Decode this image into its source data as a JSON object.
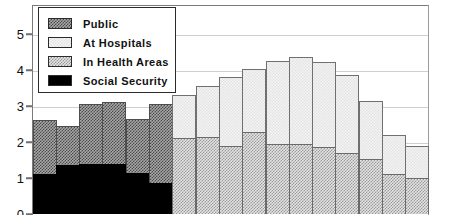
{
  "chart_data": {
    "type": "bar",
    "title": "",
    "subtitle": "",
    "xlabel": "",
    "ylabel": "",
    "stacked": true,
    "grid": true,
    "legend_position": "top-left",
    "ylim": [
      0,
      5.55
    ],
    "yticks": [
      0,
      1,
      2,
      3,
      4,
      5
    ],
    "ytick_labels": [
      "0",
      "1",
      "2",
      "3",
      "4",
      "5"
    ],
    "categories": [
      "1",
      "2",
      "3",
      "4",
      "5",
      "6",
      "7",
      "8",
      "9",
      "10",
      "11",
      "12",
      "13",
      "14",
      "15",
      "16",
      "17"
    ],
    "series": [
      {
        "name": "Public",
        "color": "#7a7a7a",
        "pattern": "dark-checker",
        "values": [
          1.5,
          1.1,
          1.65,
          1.7,
          1.5,
          2.2,
          0,
          0,
          0,
          0,
          0,
          0,
          0,
          0,
          0,
          0,
          0
        ]
      },
      {
        "name": "At Hospitals",
        "color": "#f2f2f2",
        "pattern": "light-plain",
        "values": [
          0,
          0,
          0,
          0,
          0,
          0,
          1.2,
          1.4,
          1.9,
          1.75,
          2.3,
          2.4,
          2.35,
          2.15,
          1.6,
          1.1,
          0.9
        ]
      },
      {
        "name": "In Health Areas",
        "color": "#c9c9c9",
        "pattern": "light-checker",
        "values": [
          0,
          0,
          0,
          0,
          0,
          0,
          2.1,
          2.15,
          1.9,
          2.27,
          1.95,
          1.95,
          1.87,
          1.7,
          1.53,
          1.1,
          1.0
        ]
      },
      {
        "name": "Social Security",
        "color": "#000000",
        "pattern": "solid",
        "values": [
          1.1,
          1.35,
          1.4,
          1.4,
          1.15,
          0.85,
          0,
          0,
          0,
          0,
          0,
          0,
          0,
          0,
          0,
          0,
          0
        ]
      }
    ],
    "totals": [
      2.6,
      2.45,
      3.05,
      3.1,
      2.65,
      3.05,
      3.3,
      3.55,
      3.8,
      4.02,
      4.25,
      4.35,
      4.22,
      3.85,
      3.13,
      2.2,
      1.9
    ]
  },
  "legend": {
    "items": [
      {
        "label": "Public",
        "swatch": "public-swatch"
      },
      {
        "label": "At Hospitals",
        "swatch": "hospitals-swatch"
      },
      {
        "label": "In Health Areas",
        "swatch": "health-areas-swatch"
      },
      {
        "label": "Social Security",
        "swatch": "social-security-swatch"
      }
    ]
  }
}
